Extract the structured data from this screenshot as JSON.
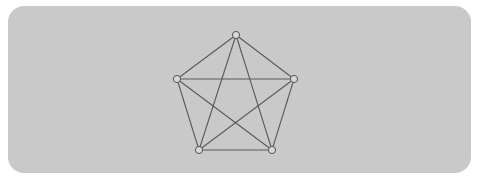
{
  "diagram": {
    "type": "complete-graph",
    "name": "K5",
    "colors": {
      "panel": "#c9c9c9",
      "edge": "#5a5a5a",
      "node_fill": "#d8d8d8",
      "node_stroke": "#555555"
    },
    "nodes": [
      {
        "id": "top"
      },
      {
        "id": "left"
      },
      {
        "id": "right"
      },
      {
        "id": "bottom-left"
      },
      {
        "id": "bottom-right"
      }
    ],
    "edges": [
      [
        "top",
        "left"
      ],
      [
        "top",
        "right"
      ],
      [
        "top",
        "bottom-left"
      ],
      [
        "top",
        "bottom-right"
      ],
      [
        "left",
        "right"
      ],
      [
        "left",
        "bottom-left"
      ],
      [
        "left",
        "bottom-right"
      ],
      [
        "right",
        "bottom-left"
      ],
      [
        "right",
        "bottom-right"
      ],
      [
        "bottom-left",
        "bottom-right"
      ]
    ]
  }
}
